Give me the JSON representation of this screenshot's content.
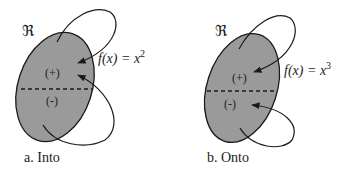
{
  "colors": {
    "region_fill": "#9a9a9a",
    "stroke": "#1a1a1a",
    "background": "#ffffff"
  },
  "panels": [
    {
      "id": "a",
      "set_symbol": "ℜ",
      "positive_label": "(+)",
      "negative_label": "(-)",
      "function_label_prefix": "f(x) = x",
      "function_exponent": "2",
      "caption": "a. Into"
    },
    {
      "id": "b",
      "set_symbol": "ℜ",
      "positive_label": "(+)",
      "negative_label": "(-)",
      "function_label_prefix": "f(x) = x",
      "function_exponent": "3",
      "caption": "b. Onto"
    }
  ]
}
